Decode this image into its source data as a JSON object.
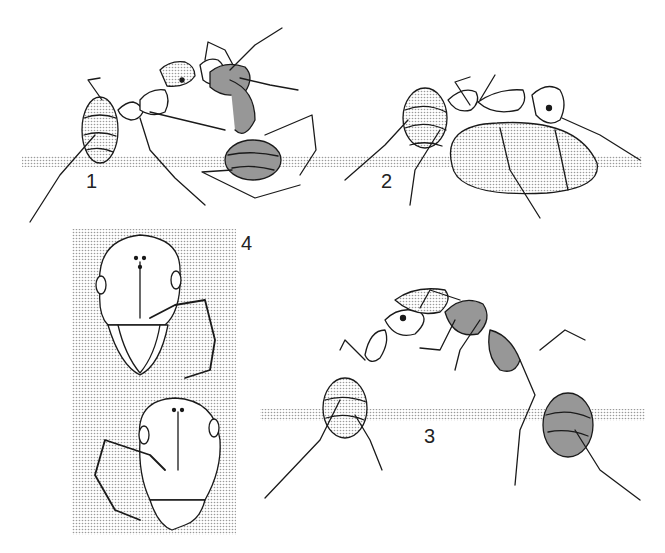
{
  "figure": {
    "colors": {
      "ink": "#1a1a1a",
      "stipple": "#cfcfcf",
      "paper": "#ffffff"
    },
    "panels": [
      {
        "label": "1",
        "subject": "two ants in trophallaxis, one upright and one upside-down"
      },
      {
        "label": "2",
        "subject": "ant with distended droplet of liquid food"
      },
      {
        "label": "3",
        "subject": "two ants facing each other exchanging food"
      },
      {
        "label": "4",
        "subject": "frontal views of two ant heads with antennae and mandibles"
      }
    ]
  }
}
